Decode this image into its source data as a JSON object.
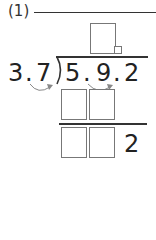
{
  "problem_label": "(1)",
  "divisor": {
    "d1": "3",
    "dot": ".",
    "d2": "7"
  },
  "dividend": {
    "d1": "5",
    "dot1": ".",
    "d2": "9",
    "dot2": ".",
    "d3": "2"
  },
  "remainder_digit": "2",
  "colors": {
    "ink": "#222222",
    "box_border": "#777777",
    "arrow": "#888888"
  }
}
